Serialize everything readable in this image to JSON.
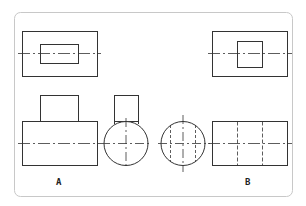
{
  "diagram": {
    "type": "orthographic-projection-exercise",
    "colors": {
      "line": "#333333",
      "frame": "#c8c8c8",
      "background": "#ffffff"
    },
    "labels": {
      "a": "A",
      "b": "B"
    },
    "figures": [
      {
        "id": "A",
        "views": [
          "top-view",
          "front-view",
          "side-view"
        ]
      },
      {
        "id": "B",
        "views": [
          "top-view",
          "front-view",
          "side-view"
        ]
      }
    ]
  }
}
